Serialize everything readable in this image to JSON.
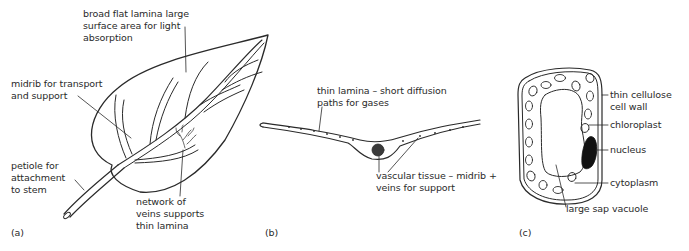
{
  "panels": {
    "a": {
      "tag": "(a)",
      "title": "leaf external structure",
      "labels": {
        "lamina_1": "broad flat lamina large",
        "lamina_2": "surface area for light",
        "lamina_3": "absorption",
        "midrib_1": "midrib for transport",
        "midrib_2": "and support",
        "petiole_1": "petiole for",
        "petiole_2": "attachment",
        "petiole_3": "to stem",
        "veins_1": "network of",
        "veins_2": "veins supports",
        "veins_3": "thin lamina"
      }
    },
    "b": {
      "tag": "(b)",
      "title": "leaf cross-section",
      "labels": {
        "thin_1": "thin lamina – short diffusion",
        "thin_2": "paths for gases",
        "vasc_1": "vascular tissue – midrib +",
        "vasc_2": "veins for support"
      }
    },
    "c": {
      "tag": "(c)",
      "title": "palisade cell",
      "labels": {
        "wall_1": "thin cellulose",
        "wall_2": "cell wall",
        "chloroplast": "chloroplast",
        "nucleus": "nucleus",
        "cytoplasm": "cytoplasm",
        "vacuole": "large sap vacuole"
      }
    }
  },
  "colors": {
    "ink": "#2a2a2a",
    "nucleus": "#111111",
    "vascular": "#3a3a3a"
  }
}
